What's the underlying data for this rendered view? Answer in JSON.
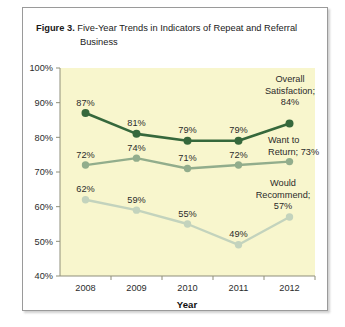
{
  "figure": {
    "label": "Figure 3.",
    "title_line1": "Five-Year Trends in Indicators of Repeat and Referral",
    "title_line2": "Business"
  },
  "chart_data": {
    "type": "line",
    "title": "Five-Year Trends in Indicators of Repeat and Referral Business",
    "xlabel": "Year",
    "ylabel": "",
    "categories": [
      "2008",
      "2009",
      "2010",
      "2011",
      "2012"
    ],
    "ylim": [
      40,
      100
    ],
    "ytick_labels": [
      "40%",
      "50%",
      "60%",
      "70%",
      "80%",
      "90%",
      "100%"
    ],
    "ytick_values": [
      40,
      50,
      60,
      70,
      80,
      90,
      100
    ],
    "grid": false,
    "legend_position": "inline-right-annotations",
    "plot_background": "#f8f6cd",
    "series": [
      {
        "name": "Overall Satisfaction",
        "color": "#36683c",
        "values": [
          87,
          81,
          79,
          79,
          84
        ],
        "labels": [
          "87%",
          "81%",
          "79%",
          "79%",
          ""
        ],
        "annotation": "Overall\nSatisfaction;\n84%",
        "annotation_lines": [
          "Overall",
          "Satisfaction;",
          "84%"
        ]
      },
      {
        "name": "Want to Return",
        "color": "#92ad8c",
        "values": [
          72,
          74,
          71,
          72,
          73
        ],
        "labels": [
          "72%",
          "74%",
          "71%",
          "72%",
          ""
        ],
        "annotation": "Want to Return; 73%",
        "annotation_lines": [
          "Want to",
          "Return; 73%"
        ]
      },
      {
        "name": "Would Recommend",
        "color": "#c3d3bd",
        "values": [
          62,
          59,
          55,
          49,
          57
        ],
        "labels": [
          "62%",
          "59%",
          "55%",
          "49%",
          ""
        ],
        "annotation": "Would Recommend; 57%",
        "annotation_lines": [
          "Would",
          "Recommend;",
          "57%"
        ]
      }
    ]
  }
}
